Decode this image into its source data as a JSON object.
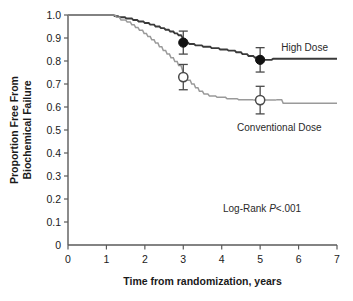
{
  "chart_data": {
    "type": "line",
    "title": "",
    "subtitle": "",
    "xlabel": "Time from randomization, years",
    "ylabel": "Proportion Free From Biochemical Failure",
    "ylabel_lines": [
      "Proportion Free From",
      "Biochemical Failure"
    ],
    "xlim": [
      0,
      7
    ],
    "ylim": [
      0,
      1.0
    ],
    "xticks": [
      0,
      1,
      2,
      3,
      4,
      5,
      6,
      7
    ],
    "xtick_labels": [
      "0",
      "1",
      "2",
      "3",
      "4",
      "5",
      "6",
      "7"
    ],
    "yticks": [
      0,
      0.1,
      0.2,
      0.3,
      0.4,
      0.5,
      0.6,
      0.7,
      0.8,
      0.9,
      1.0
    ],
    "ytick_labels": [
      "0",
      "0.1",
      "0.2",
      "0.3",
      "0.4",
      "0.5",
      "0.6",
      "0.7",
      "0.8",
      "0.9",
      "1.0"
    ],
    "grid": false,
    "legend_position": "inline-right",
    "annotations": [
      {
        "name": "log-rank-annotation",
        "text_prefix": "Log-Rank ",
        "text_italic": "P",
        "text_suffix": "<.001",
        "x": 5.05,
        "y": 0.145
      }
    ],
    "series": [
      {
        "name": "High Dose",
        "label": "High Dose",
        "color": "#3a3a3a",
        "linewidth": 1.9,
        "marker": "filled-circle",
        "label_x": 5.55,
        "label_y": 0.845,
        "points": [
          [
            0.0,
            1.0
          ],
          [
            1.18,
            1.0
          ],
          [
            1.22,
            0.995
          ],
          [
            1.3,
            0.995
          ],
          [
            1.34,
            0.99
          ],
          [
            1.48,
            0.99
          ],
          [
            1.52,
            0.985
          ],
          [
            1.66,
            0.985
          ],
          [
            1.7,
            0.978
          ],
          [
            1.8,
            0.978
          ],
          [
            1.84,
            0.972
          ],
          [
            1.96,
            0.972
          ],
          [
            2.0,
            0.965
          ],
          [
            2.1,
            0.965
          ],
          [
            2.14,
            0.958
          ],
          [
            2.24,
            0.958
          ],
          [
            2.28,
            0.95
          ],
          [
            2.38,
            0.95
          ],
          [
            2.42,
            0.943
          ],
          [
            2.5,
            0.943
          ],
          [
            2.54,
            0.936
          ],
          [
            2.62,
            0.936
          ],
          [
            2.66,
            0.928
          ],
          [
            2.74,
            0.928
          ],
          [
            2.78,
            0.92
          ],
          [
            2.84,
            0.92
          ],
          [
            2.88,
            0.912
          ],
          [
            2.94,
            0.912
          ],
          [
            2.98,
            0.902
          ],
          [
            3.0,
            0.88
          ],
          [
            3.12,
            0.88
          ],
          [
            3.16,
            0.874
          ],
          [
            3.28,
            0.874
          ],
          [
            3.32,
            0.868
          ],
          [
            3.48,
            0.868
          ],
          [
            3.52,
            0.862
          ],
          [
            3.7,
            0.862
          ],
          [
            3.74,
            0.856
          ],
          [
            3.92,
            0.856
          ],
          [
            3.96,
            0.85
          ],
          [
            4.14,
            0.85
          ],
          [
            4.18,
            0.845
          ],
          [
            4.34,
            0.845
          ],
          [
            4.38,
            0.838
          ],
          [
            4.5,
            0.838
          ],
          [
            4.54,
            0.83
          ],
          [
            4.66,
            0.83
          ],
          [
            4.7,
            0.822
          ],
          [
            4.82,
            0.822
          ],
          [
            4.86,
            0.815
          ],
          [
            4.96,
            0.815
          ],
          [
            5.0,
            0.805
          ],
          [
            5.3,
            0.805
          ],
          [
            5.34,
            0.81
          ],
          [
            7.0,
            0.81
          ]
        ],
        "markers": [
          {
            "x": 3,
            "y": 0.88,
            "err_low": 0.05,
            "err_high": 0.05
          },
          {
            "x": 5,
            "y": 0.805,
            "err_low": 0.053,
            "err_high": 0.053
          }
        ]
      },
      {
        "name": "Conventional Dose",
        "label": "Conventional Dose",
        "color": "#9a9a9a",
        "linewidth": 1.5,
        "marker": "open-circle",
        "label_x": 4.4,
        "label_y": 0.495,
        "points": [
          [
            0.0,
            1.0
          ],
          [
            1.22,
            1.0
          ],
          [
            1.26,
            0.99
          ],
          [
            1.34,
            0.99
          ],
          [
            1.38,
            0.978
          ],
          [
            1.5,
            0.978
          ],
          [
            1.54,
            0.97
          ],
          [
            1.62,
            0.97
          ],
          [
            1.66,
            0.958
          ],
          [
            1.72,
            0.958
          ],
          [
            1.76,
            0.946
          ],
          [
            1.82,
            0.946
          ],
          [
            1.86,
            0.934
          ],
          [
            1.94,
            0.934
          ],
          [
            1.98,
            0.92
          ],
          [
            2.04,
            0.92
          ],
          [
            2.08,
            0.906
          ],
          [
            2.14,
            0.906
          ],
          [
            2.18,
            0.892
          ],
          [
            2.24,
            0.892
          ],
          [
            2.28,
            0.878
          ],
          [
            2.34,
            0.878
          ],
          [
            2.38,
            0.862
          ],
          [
            2.44,
            0.862
          ],
          [
            2.48,
            0.846
          ],
          [
            2.54,
            0.846
          ],
          [
            2.58,
            0.83
          ],
          [
            2.64,
            0.83
          ],
          [
            2.68,
            0.814
          ],
          [
            2.74,
            0.814
          ],
          [
            2.78,
            0.798
          ],
          [
            2.84,
            0.798
          ],
          [
            2.88,
            0.78
          ],
          [
            2.94,
            0.78
          ],
          [
            2.98,
            0.76
          ],
          [
            3.0,
            0.73
          ],
          [
            3.08,
            0.73
          ],
          [
            3.12,
            0.716
          ],
          [
            3.18,
            0.716
          ],
          [
            3.22,
            0.7
          ],
          [
            3.28,
            0.7
          ],
          [
            3.32,
            0.684
          ],
          [
            3.38,
            0.684
          ],
          [
            3.42,
            0.668
          ],
          [
            3.5,
            0.668
          ],
          [
            3.54,
            0.656
          ],
          [
            3.64,
            0.656
          ],
          [
            3.68,
            0.648
          ],
          [
            3.84,
            0.648
          ],
          [
            3.88,
            0.642
          ],
          [
            4.1,
            0.642
          ],
          [
            4.14,
            0.636
          ],
          [
            4.4,
            0.636
          ],
          [
            4.44,
            0.632
          ],
          [
            4.8,
            0.632
          ],
          [
            4.84,
            0.63
          ],
          [
            5.0,
            0.63
          ],
          [
            5.4,
            0.63
          ],
          [
            5.44,
            0.632
          ],
          [
            5.56,
            0.632
          ],
          [
            5.6,
            0.616
          ],
          [
            7.0,
            0.616
          ]
        ],
        "markers": [
          {
            "x": 3,
            "y": 0.73,
            "err_low": 0.055,
            "err_high": 0.055
          },
          {
            "x": 5,
            "y": 0.63,
            "err_low": 0.06,
            "err_high": 0.06
          }
        ]
      }
    ]
  },
  "axes": {
    "x_title": "Time from randomization, years",
    "y_title_line1": "Proportion Free From",
    "y_title_line2": "Biochemical Failure"
  },
  "colors": {
    "high_dose": "#3a3a3a",
    "conventional_dose": "#9a9a9a",
    "axis": "#5a5a5a",
    "text": "#1a1a1a",
    "background": "#ffffff"
  }
}
